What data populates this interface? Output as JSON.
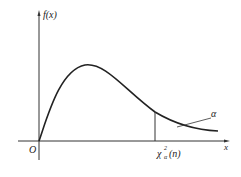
{
  "diagram": {
    "labels": {
      "y_axis": "f(x)",
      "x_axis": "x",
      "origin": "O",
      "quantile_base": "χ",
      "quantile_sup": "2",
      "quantile_sub": "α",
      "quantile_arg": "(n)",
      "tail_area": "α"
    },
    "colors": {
      "stroke": "#222222",
      "background": "#ffffff"
    }
  }
}
